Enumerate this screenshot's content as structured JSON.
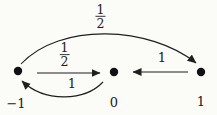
{
  "figure": {
    "states": [
      {
        "label": "−1"
      },
      {
        "label": "0"
      },
      {
        "label": "1"
      }
    ],
    "transitions": [
      {
        "from": "−1",
        "to": "1",
        "probability": "1/2",
        "numerator": "1",
        "denominator": "2",
        "style": "arc-above"
      },
      {
        "from": "−1",
        "to": "0",
        "probability": "1/2",
        "numerator": "1",
        "denominator": "2",
        "style": "straight"
      },
      {
        "from": "0",
        "to": "−1",
        "probability": "1",
        "style": "arc-below"
      },
      {
        "from": "1",
        "to": "0",
        "probability": "1",
        "style": "straight"
      }
    ],
    "ink_color": "#1f1f1f",
    "background_color": "#fbfbf8"
  }
}
